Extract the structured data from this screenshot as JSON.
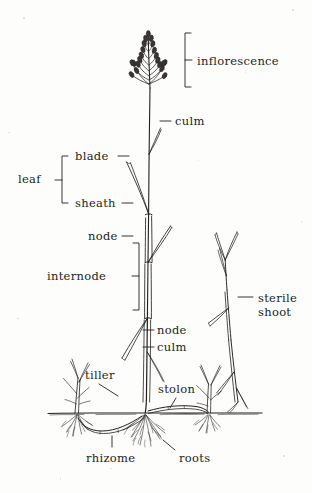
{
  "diagram": {
    "style": "pen-and-ink botanical line drawing",
    "background_color": "#fdfdfc",
    "ink_color": "#231f20",
    "canvas": {
      "width": 312,
      "height": 493
    }
  },
  "labels": [
    {
      "id": "inflorescence",
      "text": "inflorescence",
      "x": 197,
      "y": 55,
      "align": "left",
      "annotation": "bracket"
    },
    {
      "id": "culm_upper",
      "text": "culm",
      "x": 175,
      "y": 122,
      "align": "left",
      "annotation": "dash"
    },
    {
      "id": "leaf",
      "text": "leaf",
      "x": 18,
      "y": 179,
      "align": "left",
      "annotation": "bracket"
    },
    {
      "id": "blade",
      "text": "blade",
      "x": 75,
      "y": 157,
      "align": "left",
      "annotation": "dash"
    },
    {
      "id": "sheath",
      "text": "sheath",
      "x": 75,
      "y": 204,
      "align": "left",
      "annotation": "dash"
    },
    {
      "id": "node_upper",
      "text": "node",
      "x": 88,
      "y": 237,
      "align": "left",
      "annotation": "dash"
    },
    {
      "id": "internode",
      "text": "internode",
      "x": 47,
      "y": 276,
      "align": "left",
      "annotation": "bracket"
    },
    {
      "id": "node_lower",
      "text": "node",
      "x": 157,
      "y": 331,
      "align": "left",
      "annotation": "dash"
    },
    {
      "id": "culm_lower",
      "text": "culm",
      "x": 157,
      "y": 348,
      "align": "left",
      "annotation": "dash"
    },
    {
      "id": "sterile_shoot",
      "text": "sterile\nshoot",
      "x": 258,
      "y": 303,
      "align": "left",
      "annotation": "dash"
    },
    {
      "id": "tiller",
      "text": "tiller",
      "x": 85,
      "y": 369,
      "align": "left",
      "annotation": "leader"
    },
    {
      "id": "stolon",
      "text": "stolon",
      "x": 158,
      "y": 383,
      "align": "left",
      "annotation": "leader"
    },
    {
      "id": "rhizome",
      "text": "rhizome",
      "x": 86,
      "y": 452,
      "align": "left",
      "annotation": "leader"
    },
    {
      "id": "roots",
      "text": "roots",
      "x": 179,
      "y": 452,
      "align": "left",
      "annotation": "leader"
    }
  ],
  "parts": [
    {
      "id": "inflorescence",
      "name": "inflorescence",
      "description": "open panicle with spikelets on alternating branches"
    },
    {
      "id": "culm",
      "name": "culm",
      "description": "erect flowering stem"
    },
    {
      "id": "blade",
      "name": "blade",
      "description": "flat upper part of the leaf"
    },
    {
      "id": "sheath",
      "name": "sheath",
      "description": "lower part of leaf wrapping the culm"
    },
    {
      "id": "node",
      "name": "node",
      "description": "joint on the culm where a leaf arises"
    },
    {
      "id": "internode",
      "name": "internode",
      "description": "culm segment between two nodes"
    },
    {
      "id": "sterile-shoot",
      "name": "sterile shoot",
      "description": "vegetative non-flowering shoot"
    },
    {
      "id": "tiller",
      "name": "tiller",
      "description": "side shoot arising at the base"
    },
    {
      "id": "stolon",
      "name": "stolon",
      "description": "above-ground creeping stem"
    },
    {
      "id": "rhizome",
      "name": "rhizome",
      "description": "below-ground creeping stem"
    },
    {
      "id": "roots",
      "name": "roots",
      "description": "fibrous root system"
    },
    {
      "id": "soil-line",
      "name": "soil line",
      "description": "ground surface"
    }
  ]
}
